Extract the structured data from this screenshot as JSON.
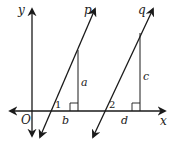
{
  "diagram": {
    "type": "coordinate geometry figure",
    "colors": {
      "line": "#1a1a1a",
      "background": "#ffffff"
    },
    "axes": {
      "x_label": "x",
      "y_label": "y",
      "origin_label": "O"
    },
    "lines": [
      {
        "id": "p",
        "label": "p"
      },
      {
        "id": "q",
        "label": "q"
      }
    ],
    "segments": [
      {
        "id": "a",
        "label": "a",
        "description": "vertical segment from line p to x-axis"
      },
      {
        "id": "c",
        "label": "c",
        "description": "vertical segment from line q to x-axis"
      },
      {
        "id": "b",
        "label": "b",
        "description": "horizontal distance along x-axis under p"
      },
      {
        "id": "d",
        "label": "d",
        "description": "horizontal distance along x-axis under q"
      }
    ],
    "angles": [
      {
        "id": "angle1",
        "label": "1"
      },
      {
        "id": "angle2",
        "label": "2"
      }
    ],
    "right_angle_markers": 2
  }
}
